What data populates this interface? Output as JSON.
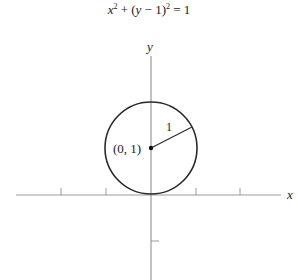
{
  "diagram": {
    "title_parts": {
      "x": "x",
      "exp1": "2",
      "plus": " + (",
      "y": "y",
      "minus": " − 1)",
      "exp2": "2",
      "equals": " = 1"
    },
    "equation": "x^2 + (y - 1)^2 = 1",
    "axes": {
      "x_label": "x",
      "y_label": "y"
    },
    "circle": {
      "center": [
        0,
        1
      ],
      "radius": 1
    },
    "center_label": "(0, 1)",
    "radius_label": "1",
    "colors": {
      "stroke": "#2a2a2a",
      "axis": "#9a9a9a",
      "background": "#ffffff"
    }
  }
}
